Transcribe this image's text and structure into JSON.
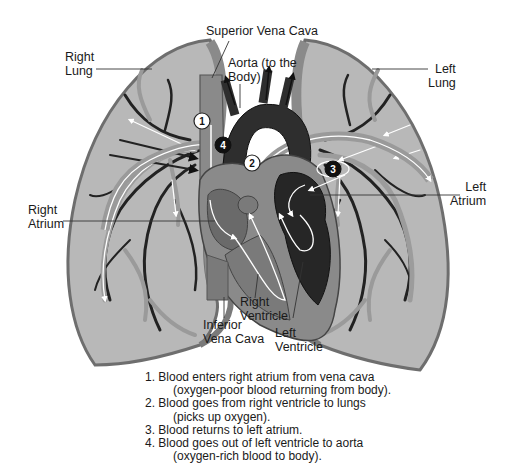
{
  "diagram": {
    "labels": {
      "superior_vena_cava": "Superior Vena Cava",
      "aorta_line1": "Aorta (to the",
      "aorta_line2": "Body)",
      "right_lung_line1": "Right",
      "right_lung_line2": "Lung",
      "left_lung_line1": "Left",
      "left_lung_line2": "Lung",
      "right_atrium_line1": "Right",
      "right_atrium_line2": "Atrium",
      "left_atrium_line1": "Left",
      "left_atrium_line2": "Atrium",
      "right_ventricle_line1": "Right",
      "right_ventricle_line2": "Ventricle",
      "left_ventricle_line1": "Left",
      "left_ventricle_line2": "Ventricle",
      "inferior_vena_cava_line1": "Inferior",
      "inferior_vena_cava_line2": "Vena Cava"
    },
    "badges": [
      "1",
      "2",
      "3",
      "4"
    ],
    "steps": [
      {
        "line1": "1. Blood enters right atrium from vena cava",
        "line2": "(oxygen-poor blood returning from body)."
      },
      {
        "line1": "2. Blood goes from right ventricle to lungs",
        "line2": "(picks up oxygen)."
      },
      {
        "line1": "3. Blood returns to left atrium.",
        "line2": ""
      },
      {
        "line1": "4. Blood goes out of left ventricle to aorta",
        "line2": "(oxygen-rich blood to body)."
      }
    ],
    "colors": {
      "lung_fill": "#b4b4b4",
      "lung_edge": "#7a7a7a",
      "heart_mid": "#8a8a8a",
      "heart_dark": "#2a2a2a",
      "vessel_dark": "#222222",
      "vessel_light": "#9a9a9a",
      "arrow": "#ffffff"
    }
  }
}
